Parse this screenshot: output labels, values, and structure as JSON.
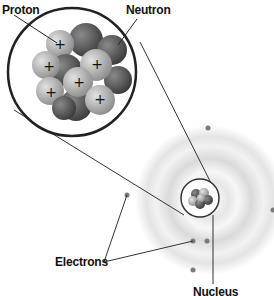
{
  "diagram": {
    "labels": {
      "proton": "Proton",
      "neutron": "Neutron",
      "electrons": "Electrons",
      "nucleus": "Nucleus"
    },
    "plus_sign": "+",
    "colors": {
      "proton": "#b8b8b8",
      "neutron": "#5a5a5a",
      "outline": "#2a2a2a",
      "electron": "#7a7a7a",
      "cloud": "#cfcfcf"
    }
  }
}
